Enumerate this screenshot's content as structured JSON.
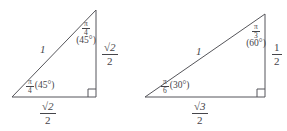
{
  "figure": {
    "title_visible": false,
    "background_color": "#ffffff",
    "line_color": "#45454a",
    "triangles": [
      {
        "id": "triangle-45-45-90",
        "name": "isosceles-right-triangle",
        "vertices": {
          "apex": [
            96,
            10
          ],
          "bottom_left": [
            12,
            97
          ],
          "bottom_right": [
            96,
            97
          ]
        },
        "right_angle_at": "bottom-right",
        "hypotenuse_label": "1",
        "apex_angle": {
          "radians_num": "π",
          "radians_den": "4",
          "degrees": "(45°)"
        },
        "base_angle": {
          "radians_num": "π",
          "radians_den": "4",
          "degrees": "(45°)"
        },
        "vertical_side_label": {
          "num": "√2",
          "den": "2"
        },
        "base_side_label": {
          "num": "√2",
          "den": "2"
        }
      },
      {
        "id": "triangle-30-60-90",
        "name": "thirty-sixty-ninety-triangle",
        "vertices": {
          "apex": [
            265,
            14
          ],
          "bottom_left": [
            145,
            97
          ],
          "bottom_right": [
            265,
            97
          ]
        },
        "right_angle_at": "bottom-right",
        "hypotenuse_label": "1",
        "apex_angle": {
          "radians_num": "π",
          "radians_den": "3",
          "degrees": "(60°)"
        },
        "base_angle": {
          "radians_num": "π",
          "radians_den": "6",
          "degrees": "(30°)"
        },
        "vertical_side_label": {
          "num": "1",
          "den": "2"
        },
        "base_side_label": {
          "num": "√3",
          "den": "2"
        }
      }
    ]
  }
}
